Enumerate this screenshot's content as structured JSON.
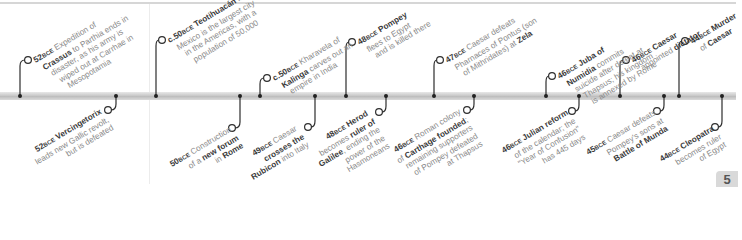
{
  "page": {
    "number": "5"
  },
  "timeline": {
    "top": [
      {
        "year": "52",
        "era": "BCE",
        "line1_b": "Expedition of",
        "line1": "",
        "l2b": "Crassus",
        "l2": " to Parthia ends in",
        "l3": "disaster, as his army is",
        "l4": "wiped out at Carrhae in",
        "l5": "Mesopotamia",
        "dot": 20,
        "cx": 28,
        "cy": 60
      },
      {
        "year": "c.50",
        "era": "BCE",
        "l1b": "Teotihuacán",
        "l1": " in",
        "l2": "Mexico is the largest city",
        "l3": "in the Americas, with a",
        "l4": "population of 50,000",
        "dot": 156,
        "cx": 162,
        "cy": 40
      },
      {
        "year": "c.50",
        "era": "BCE",
        "l1": "Kharavela of",
        "l2b": "Kalinga",
        "l2": " carves out an",
        "l3": "empire in India",
        "dot": 260,
        "cx": 267,
        "cy": 78
      },
      {
        "year": "48",
        "era": "BCE",
        "l1b": "Pompey",
        "l2": "flees to Egypt",
        "l3": "and is killed there",
        "dot": 346,
        "cx": 352,
        "cy": 42
      },
      {
        "year": "47",
        "era": "BCE",
        "l1": "Caesar defeats",
        "l2": "Pharnaces of Pontus (son",
        "l3": "of Mithridates) at ",
        "l3b": "Zela",
        "dot": 434,
        "cx": 440,
        "cy": 60
      },
      {
        "year": "46",
        "era": "BCE",
        "l1b": "Juba of",
        "l2b": "Numidia",
        "l2": " commits",
        "l3": "suicide after defeat at",
        "l4": "Thapsus; his kingdom",
        "l5": "is annexed by Rome",
        "dot": 546,
        "cx": 552,
        "cy": 76
      },
      {
        "year": "46",
        "era": "BCE",
        "l1b": "Caesar",
        "l2": "appointed ",
        "l2b": "dictator",
        "dot": 620,
        "cx": 626,
        "cy": 60
      },
      {
        "year": "44",
        "era": "BCE",
        "l1b": "Murder",
        "l2": "of ",
        "l2b": "Caesar",
        "dot": 679,
        "cx": 685,
        "cy": 41
      }
    ],
    "bottom": [
      {
        "year": "52",
        "era": "BCE",
        "l1b": "Vercingetorix",
        "l2": "leads new Gallic revolt,",
        "l3": "but is defeated",
        "dot": 116,
        "cx": 108,
        "cy": 110
      },
      {
        "year": "50",
        "era": "BCE",
        "l1": "Construction",
        "l2": "of a ",
        "l2b": "new forum",
        "l3": "in ",
        "l3b": "Rome",
        "dot": 240,
        "cx": 232,
        "cy": 128
      },
      {
        "year": "49",
        "era": "BCE",
        "l1": "Caesar",
        "l2b": "crosses the",
        "l3b": "Rubicon",
        "l3": " into Italy",
        "dot": 315,
        "cx": 308,
        "cy": 127
      },
      {
        "year": "48",
        "era": "BCE",
        "l1b": "Herod",
        "l2": "becomes ",
        "l2b": "ruler of",
        "l3b": "Galilee",
        "l3": ", ending the",
        "l4": "power of the",
        "l5": "Hasmoneans",
        "dot": 386,
        "cx": 379,
        "cy": 112
      },
      {
        "year": "46",
        "era": "BCE",
        "l1": "Roman colony",
        "l2": "of ",
        "l2b": "Carthage founded",
        "l2x": ";",
        "l3": "remaining supporters",
        "l4": "of Pompey defeated",
        "l5": "at Thapsus",
        "dot": 474,
        "cx": 467,
        "cy": 110
      },
      {
        "year": "46",
        "era": "BCE",
        "l1b": "Julian reform",
        "l2": "of the calendar; the",
        "l3": "\"Year of Confusion\"",
        "l4": "has 445 days",
        "dot": 579,
        "cx": 572,
        "cy": 111
      },
      {
        "year": "45",
        "era": "BCE",
        "l1": "Caesar defeats",
        "l2": "Pompey's sons at",
        "l3b": "Battle of Munda",
        "dot": 664,
        "cx": 657,
        "cy": 111
      },
      {
        "year": "44",
        "era": "BCE",
        "l1b": "Cleopatra",
        "l2": "becomes ruler",
        "l3": "of Egypt",
        "dot": 722,
        "cx": 715,
        "cy": 127
      }
    ]
  }
}
